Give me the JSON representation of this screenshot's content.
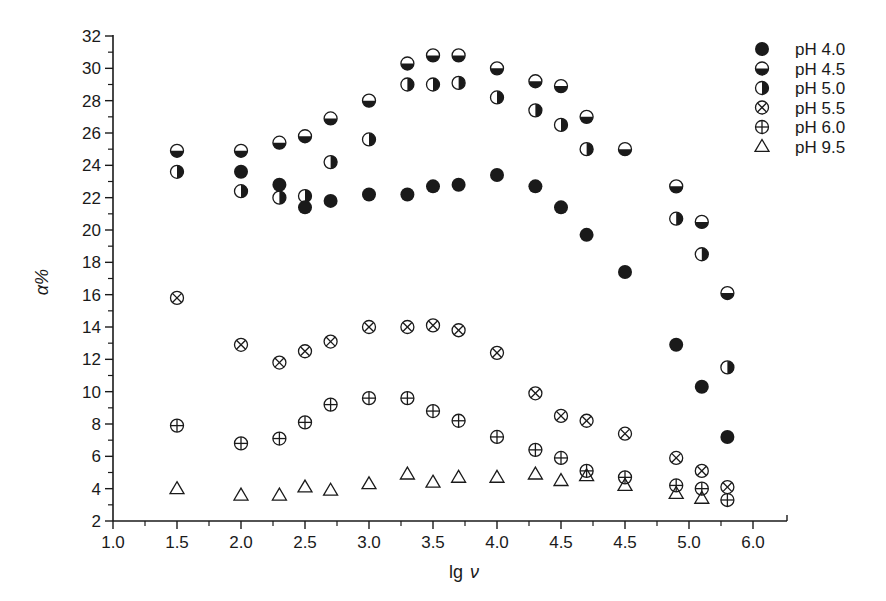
{
  "chart_data": {
    "type": "scatter",
    "title": "",
    "xlabel": "lg ν",
    "ylabel": "α%",
    "xlim": [
      1.0,
      6.25
    ],
    "ylim": [
      2,
      32
    ],
    "x_tick_labels": [
      "1.0",
      "1.5",
      "2.0",
      "2.5",
      "3.0",
      "3.5",
      "4.0",
      "4.5",
      "4.5",
      "5.0",
      "6.0"
    ],
    "y_tick_labels": [
      "2",
      "4",
      "6",
      "8",
      "10",
      "12",
      "14",
      "16",
      "18",
      "20",
      "22",
      "24",
      "26",
      "28",
      "30",
      "32"
    ],
    "grid": false,
    "legend_position": "upper right, outside plot",
    "note": "x positions given in axis units (tick spacing uniform, 0.5 per major tick as printed)",
    "series": [
      {
        "name": "pH 4.0",
        "marker": "filled-circle",
        "x": [
          1.5,
          2.0,
          2.3,
          2.5,
          2.7,
          3.0,
          3.3,
          3.5,
          3.7,
          4.0,
          4.3,
          4.5,
          4.7,
          5.0,
          5.4,
          5.6,
          5.8
        ],
        "y": [
          null,
          23.6,
          22.8,
          21.4,
          21.8,
          22.2,
          22.2,
          22.7,
          22.8,
          23.4,
          22.7,
          21.4,
          19.7,
          17.4,
          12.9,
          10.3,
          7.2
        ]
      },
      {
        "name": "pH 4.5",
        "marker": "bottom-half-filled-circle",
        "x": [
          1.5,
          2.0,
          2.3,
          2.5,
          2.7,
          3.0,
          3.3,
          3.5,
          3.7,
          4.0,
          4.3,
          4.5,
          4.7,
          5.0,
          5.4,
          5.6,
          5.8
        ],
        "y": [
          24.9,
          24.9,
          25.4,
          25.8,
          26.9,
          28.0,
          30.3,
          30.8,
          30.8,
          30.0,
          29.2,
          28.9,
          27.0,
          25.0,
          22.7,
          20.5,
          16.1
        ]
      },
      {
        "name": "pH 5.0",
        "marker": "right-half-filled-circle",
        "x": [
          1.5,
          2.0,
          2.3,
          2.5,
          2.7,
          3.0,
          3.3,
          3.5,
          3.7,
          4.0,
          4.3,
          4.5,
          4.7,
          5.0,
          5.4,
          5.6,
          5.8
        ],
        "y": [
          23.6,
          22.4,
          22.0,
          22.1,
          24.2,
          25.6,
          29.0,
          29.0,
          29.1,
          28.2,
          27.4,
          26.5,
          25.0,
          null,
          20.7,
          18.5,
          11.5
        ]
      },
      {
        "name": "pH 5.5",
        "marker": "circle-x",
        "x": [
          1.5,
          2.0,
          2.3,
          2.5,
          2.7,
          3.0,
          3.3,
          3.5,
          3.7,
          4.0,
          4.3,
          4.5,
          4.7,
          5.0,
          5.4,
          5.6,
          5.8
        ],
        "y": [
          15.8,
          12.9,
          11.8,
          12.5,
          13.1,
          14.0,
          14.0,
          14.1,
          13.8,
          12.4,
          9.9,
          8.5,
          8.2,
          7.4,
          5.9,
          5.1,
          4.1
        ]
      },
      {
        "name": "pH 6.0",
        "marker": "circle-plus",
        "x": [
          1.5,
          2.0,
          2.3,
          2.5,
          2.7,
          3.0,
          3.3,
          3.5,
          3.7,
          4.0,
          4.3,
          4.5,
          4.7,
          5.0,
          5.4,
          5.6,
          5.8
        ],
        "y": [
          7.9,
          6.8,
          7.1,
          8.1,
          9.2,
          9.6,
          9.6,
          8.8,
          8.2,
          7.2,
          6.4,
          5.9,
          5.1,
          4.7,
          4.2,
          4.0,
          3.3
        ]
      },
      {
        "name": "pH 9.5",
        "marker": "open-triangle",
        "x": [
          1.5,
          2.0,
          2.3,
          2.5,
          2.7,
          3.0,
          3.3,
          3.5,
          3.7,
          4.0,
          4.3,
          4.5,
          4.7,
          5.0,
          5.4,
          5.6,
          5.8
        ],
        "y": [
          4.0,
          3.6,
          3.6,
          4.1,
          3.9,
          4.3,
          4.9,
          4.4,
          4.7,
          4.7,
          4.9,
          4.5,
          4.8,
          4.2,
          3.7,
          3.4,
          null
        ]
      }
    ]
  },
  "legend": {
    "items": [
      {
        "label": "pH 4.0",
        "marker": "filled-circle"
      },
      {
        "label": "pH 4.5",
        "marker": "bottom-half-filled-circle"
      },
      {
        "label": "pH 5.0",
        "marker": "right-half-filled-circle"
      },
      {
        "label": "pH 5.5",
        "marker": "circle-x"
      },
      {
        "label": "pH 6.0",
        "marker": "circle-plus"
      },
      {
        "label": "pH 9.5",
        "marker": "open-triangle"
      }
    ]
  },
  "axes": {
    "x_title_main": "lg",
    "x_title_symbol": "ν",
    "y_title": "α%"
  },
  "colors": {
    "ink": "#1a1a1a",
    "background": "#ffffff"
  }
}
